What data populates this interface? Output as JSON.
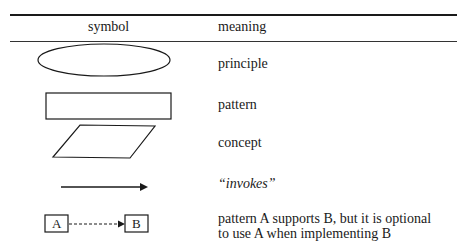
{
  "table": {
    "headers": {
      "symbol": "symbol",
      "meaning": "meaning"
    },
    "rows": [
      {
        "symbol": "ellipse",
        "meaning": "principle"
      },
      {
        "symbol": "rectangle",
        "meaning": "pattern"
      },
      {
        "symbol": "parallelogram",
        "meaning": "concept"
      },
      {
        "symbol": "solid-arrow",
        "meaning": "“invokes”"
      },
      {
        "symbol": "dashed-arrow-A-to-B",
        "box_a": "A",
        "box_b": "B",
        "meaning_line1": "pattern A supports B, but it is optional",
        "meaning_line2": "to use A when implementing B"
      }
    ]
  }
}
